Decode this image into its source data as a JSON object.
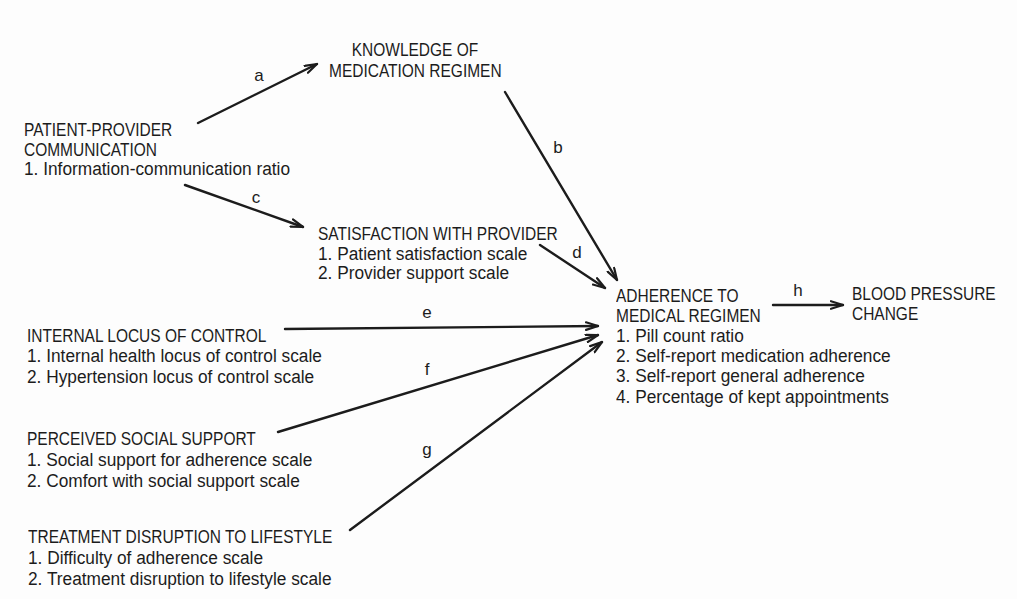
{
  "nodes": {
    "knowledge": {
      "title_lines": [
        "KNOWLEDGE OF",
        "MEDICATION REGIMEN"
      ],
      "items": []
    },
    "patient_provider": {
      "title_lines": [
        "PATIENT-PROVIDER",
        "COMMUNICATION"
      ],
      "items": [
        "1. Information-communication ratio"
      ]
    },
    "satisfaction": {
      "title_lines": [
        "SATISFACTION WITH PROVIDER"
      ],
      "items": [
        "1. Patient satisfaction scale",
        "2. Provider support scale"
      ]
    },
    "internal_locus": {
      "title_lines": [
        "INTERNAL LOCUS OF CONTROL"
      ],
      "items": [
        "1. Internal health locus of control scale",
        "2. Hypertension locus of control scale"
      ]
    },
    "social_support": {
      "title_lines": [
        "PERCEIVED SOCIAL SUPPORT"
      ],
      "items": [
        "1. Social support for adherence scale",
        "2. Comfort with social support scale"
      ]
    },
    "treatment_disruption": {
      "title_lines": [
        "TREATMENT DISRUPTION TO LIFESTYLE"
      ],
      "items": [
        "1. Difficulty of adherence scale",
        "2. Treatment disruption to lifestyle scale"
      ]
    },
    "adherence": {
      "title_lines": [
        "ADHERENCE TO",
        "MEDICAL REGIMEN"
      ],
      "items": [
        "1. Pill count ratio",
        "2. Self-report medication adherence",
        "3. Self-report general adherence",
        "4. Percentage of kept appointments"
      ]
    },
    "blood_pressure": {
      "title_lines": [
        "BLOOD PRESSURE",
        "CHANGE"
      ],
      "items": []
    }
  },
  "paths": [
    {
      "label": "a",
      "from": "patient_provider",
      "to": "knowledge"
    },
    {
      "label": "b",
      "from": "knowledge",
      "to": "adherence"
    },
    {
      "label": "c",
      "from": "patient_provider",
      "to": "satisfaction"
    },
    {
      "label": "d",
      "from": "satisfaction",
      "to": "adherence"
    },
    {
      "label": "e",
      "from": "internal_locus",
      "to": "adherence"
    },
    {
      "label": "f",
      "from": "social_support",
      "to": "adherence"
    },
    {
      "label": "g",
      "from": "treatment_disruption",
      "to": "adherence"
    },
    {
      "label": "h",
      "from": "adherence",
      "to": "blood_pressure"
    }
  ]
}
